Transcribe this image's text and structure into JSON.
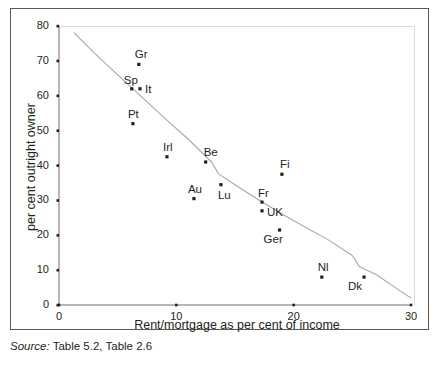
{
  "chart_data": {
    "type": "scatter",
    "title": "",
    "xlabel": "Rent/mortgage as per cent of income",
    "ylabel": "per cent outright owner",
    "xlim": [
      0,
      30
    ],
    "ylim": [
      0,
      80
    ],
    "xticks": [
      "0",
      "10",
      "20",
      "30"
    ],
    "xtick_values": [
      0,
      10,
      20,
      30
    ],
    "yticks": [
      "0",
      "10",
      "20",
      "30",
      "40",
      "50",
      "60",
      "70",
      "80"
    ],
    "ytick_values": [
      0,
      10,
      20,
      30,
      40,
      50,
      60,
      70,
      80
    ],
    "grid": false,
    "legend": "none",
    "points": [
      {
        "label": "Gr",
        "x": 6.8,
        "y": 69.0,
        "label_dx": -4,
        "label_dy": -15
      },
      {
        "label": "Sp",
        "x": 6.2,
        "y": 62.0,
        "label_dx": -8,
        "label_dy": -14
      },
      {
        "label": "It",
        "x": 6.9,
        "y": 62.0,
        "label_dx": 5,
        "label_dy": -5
      },
      {
        "label": "Pt",
        "x": 6.3,
        "y": 52.0,
        "label_dx": -5,
        "label_dy": -15
      },
      {
        "label": "Irl",
        "x": 9.2,
        "y": 42.5,
        "label_dx": -4,
        "label_dy": -15
      },
      {
        "label": "Be",
        "x": 12.5,
        "y": 41.0,
        "label_dx": -2,
        "label_dy": -15
      },
      {
        "label": "Au",
        "x": 11.5,
        "y": 30.5,
        "label_dx": -6,
        "label_dy": -15
      },
      {
        "label": "Lu",
        "x": 13.8,
        "y": 34.5,
        "label_dx": -3,
        "label_dy": 5
      },
      {
        "label": "Fi",
        "x": 19.0,
        "y": 37.5,
        "label_dx": -2,
        "label_dy": -15
      },
      {
        "label": "Fr",
        "x": 17.3,
        "y": 29.5,
        "label_dx": -4,
        "label_dy": -14
      },
      {
        "label": "UK",
        "x": 17.3,
        "y": 27.0,
        "label_dx": 5,
        "label_dy": -4
      },
      {
        "label": "Ger",
        "x": 18.8,
        "y": 21.5,
        "label_dx": -16,
        "label_dy": 4
      },
      {
        "label": "Nl",
        "x": 22.4,
        "y": 8.0,
        "label_dx": -4,
        "label_dy": -15
      },
      {
        "label": "Dk",
        "x": 26.0,
        "y": 8.0,
        "label_dx": -16,
        "label_dy": 4
      }
    ],
    "trend_line": {
      "name": "fitted trend curve",
      "x": [
        1.3,
        3.0,
        5.0,
        7.0,
        9.0,
        11.0,
        13.0,
        13.6,
        15.0,
        17.0,
        19.0,
        21.0,
        23.0,
        25.0,
        25.6,
        27.0,
        29.0,
        30.0
      ],
      "y": [
        78.0,
        72.3,
        66.0,
        59.8,
        53.6,
        47.6,
        41.0,
        37.6,
        34.5,
        30.2,
        26.1,
        22.3,
        18.6,
        14.2,
        11.0,
        8.8,
        4.2,
        2.0
      ]
    },
    "source": {
      "label": "Source:",
      "text": "Table 5.2, Table 2.6"
    }
  }
}
